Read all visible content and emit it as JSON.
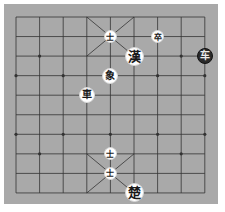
{
  "board": {
    "type": "xiangqi",
    "columns": 9,
    "rows": 10,
    "grid": {
      "x0": 16,
      "y0": 17,
      "dx": 23.6,
      "dy": 19.55
    },
    "colors": {
      "background": "#a9a9a9",
      "line": "#333333",
      "page": "#ffffff"
    },
    "star_points": [
      [
        1,
        2
      ],
      [
        7,
        2
      ],
      [
        0,
        3
      ],
      [
        2,
        3
      ],
      [
        4,
        3
      ],
      [
        6,
        3
      ],
      [
        8,
        3
      ],
      [
        0,
        6
      ],
      [
        2,
        6
      ],
      [
        4,
        6
      ],
      [
        6,
        6
      ],
      [
        8,
        6
      ],
      [
        1,
        7
      ],
      [
        7,
        7
      ]
    ]
  },
  "pieces": [
    {
      "char": "士",
      "name": "advisor",
      "col": 4,
      "row": 1,
      "side": "light",
      "size": "small"
    },
    {
      "char": "卒",
      "name": "soldier",
      "col": 6,
      "row": 1,
      "side": "light",
      "size": "small"
    },
    {
      "char": "漢",
      "name": "han-general",
      "col": 5,
      "row": 2,
      "side": "light",
      "size": "large"
    },
    {
      "char": "车",
      "name": "chariot",
      "col": 8,
      "row": 2,
      "side": "dark",
      "size": "medium"
    },
    {
      "char": "象",
      "name": "elephant",
      "col": 4,
      "row": 3,
      "side": "light",
      "size": "medium"
    },
    {
      "char": "車",
      "name": "chariot",
      "col": 3,
      "row": 4,
      "side": "light",
      "size": "medium"
    },
    {
      "char": "士",
      "name": "advisor",
      "col": 4,
      "row": 7,
      "side": "light",
      "size": "small"
    },
    {
      "char": "士",
      "name": "advisor",
      "col": 4,
      "row": 8,
      "side": "light",
      "size": "small"
    },
    {
      "char": "楚",
      "name": "chu-general",
      "col": 5,
      "row": 9,
      "side": "light",
      "size": "large"
    }
  ]
}
